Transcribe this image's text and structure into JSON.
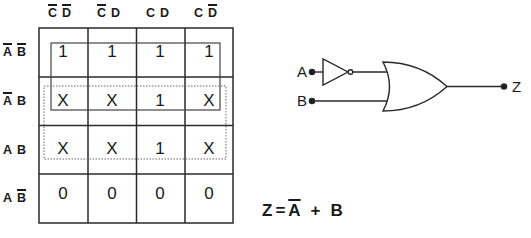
{
  "kmap": {
    "column_headers": [
      {
        "vars": [
          {
            "name": "C",
            "negated": true
          },
          {
            "name": "D",
            "negated": true
          }
        ]
      },
      {
        "vars": [
          {
            "name": "C",
            "negated": true
          },
          {
            "name": "D",
            "negated": false
          }
        ]
      },
      {
        "vars": [
          {
            "name": "C",
            "negated": false
          },
          {
            "name": "D",
            "negated": false
          }
        ]
      },
      {
        "vars": [
          {
            "name": "C",
            "negated": false
          },
          {
            "name": "D",
            "negated": true
          }
        ]
      }
    ],
    "row_headers": [
      {
        "vars": [
          {
            "name": "A",
            "negated": true
          },
          {
            "name": "B",
            "negated": true
          }
        ]
      },
      {
        "vars": [
          {
            "name": "A",
            "negated": true
          },
          {
            "name": "B",
            "negated": false
          }
        ]
      },
      {
        "vars": [
          {
            "name": "A",
            "negated": false
          },
          {
            "name": "B",
            "negated": false
          }
        ]
      },
      {
        "vars": [
          {
            "name": "A",
            "negated": false
          },
          {
            "name": "B",
            "negated": true
          }
        ]
      }
    ],
    "cells": [
      [
        "1",
        "1",
        "1",
        "1"
      ],
      [
        "X",
        "X",
        "1",
        "X"
      ],
      [
        "X",
        "X",
        "1",
        "X"
      ],
      [
        "0",
        "0",
        "0",
        "0"
      ]
    ],
    "groups": [
      {
        "style": "solid",
        "rows": [
          0,
          1
        ],
        "label": "A-bar group"
      },
      {
        "style": "dotted",
        "rows": [
          1,
          2
        ],
        "label": "B group"
      }
    ]
  },
  "circuit": {
    "inputs": [
      "A",
      "B"
    ],
    "output": "Z",
    "gates": [
      "NOT",
      "OR"
    ]
  },
  "equation": {
    "lhs": "Z",
    "equals": "=",
    "term1": "A",
    "op": "+",
    "term2": "B"
  }
}
